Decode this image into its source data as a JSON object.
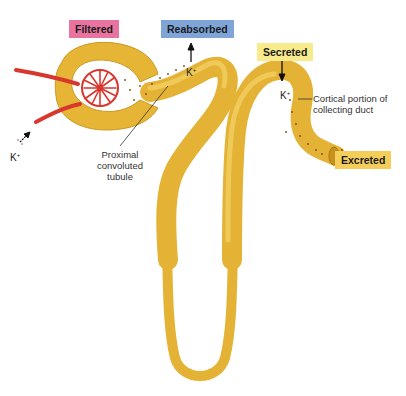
{
  "diagram": {
    "tags": {
      "filtered": "Filtered",
      "reabsorbed": "Reabsorbed",
      "secreted": "Secreted",
      "excreted": "Excreted"
    },
    "labels": {
      "proximal_tubule": "Proximal convoluted tubule",
      "collecting_duct": "Cortical portion of collecting duct"
    },
    "ion": {
      "symbol": "K",
      "charge": "+"
    },
    "colors": {
      "tubule": "#e9b93a",
      "tubule_dark": "#c9951f",
      "capillary": "#d9362e",
      "filtered_tag": "#e8739e",
      "reabsorbed_tag": "#7ea4d8",
      "secreted_tag": "#f7eb8c",
      "excreted_tag": "#f3cf5a"
    }
  }
}
